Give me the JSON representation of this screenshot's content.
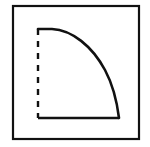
{
  "figure": {
    "name": "quarter-curve-diagram",
    "background_color": "#ffffff",
    "ink_color": "#111111",
    "canvas": {
      "width": 150,
      "height": 147
    },
    "frame": {
      "name": "outer-frame",
      "x": 13,
      "y": 6,
      "width": 126,
      "height": 133,
      "stroke_width": 2.2,
      "stroke_color": "#111111",
      "fill": "none"
    },
    "vertical_axis": {
      "name": "dashed-vertical-axis",
      "x": 38,
      "y_top": 29,
      "y_bottom": 118,
      "style": "dashed",
      "dash_length": 6,
      "dash_gap": 6,
      "stroke_width": 2.4,
      "stroke_color": "#111111"
    },
    "baseline": {
      "name": "solid-baseline",
      "y": 118,
      "x_left": 38,
      "x_right": 119,
      "style": "solid",
      "stroke_width": 2.6,
      "stroke_color": "#111111"
    },
    "curve": {
      "name": "convex-decay-curve",
      "style": "solid",
      "stroke_width": 2.6,
      "stroke_color": "#111111",
      "start_point": {
        "x": 38,
        "y": 29
      },
      "end_point": {
        "x": 119,
        "y": 118
      },
      "path": "M 38 29 L 52 29 C 72 30 92 46 105 70 C 113 85 117 102 119 118"
    }
  },
  "chart_data": {
    "type": "line",
    "title": "",
    "subtitle": "",
    "xlabel": "",
    "ylabel": "",
    "grid": false,
    "legend": null,
    "xlim": [
      38,
      119
    ],
    "ylim": [
      118,
      29
    ],
    "annotations": [],
    "series": [
      {
        "name": "convex-decay-curve",
        "style": "solid",
        "x": [
          38,
          45,
          52,
          60,
          68,
          76,
          84,
          92,
          100,
          108,
          114,
          119
        ],
        "y": [
          29,
          29,
          29,
          31,
          36,
          43,
          52,
          63,
          76,
          93,
          105,
          118
        ]
      },
      {
        "name": "dashed-vertical-axis",
        "style": "dashed",
        "x": [
          38,
          38
        ],
        "y": [
          29,
          118
        ]
      },
      {
        "name": "solid-baseline",
        "style": "solid",
        "x": [
          38,
          119
        ],
        "y": [
          118,
          118
        ]
      }
    ]
  }
}
